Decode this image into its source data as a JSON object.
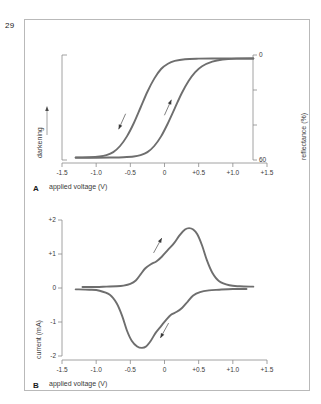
{
  "page": {
    "number": "29"
  },
  "figure": {
    "panels": [
      {
        "letter": "A",
        "xlabel": "applied voltage (V)",
        "ylabel_left": "darkening",
        "ylabel_right": "reflectance (%)"
      },
      {
        "letter": "B",
        "xlabel": "applied voltage (V)",
        "ylabel_left": "current (mA)"
      }
    ]
  },
  "style": {
    "curve_color": "#6e6e6e",
    "axis_color": "#8c8c8c",
    "text_color": "#3a3a3a",
    "frame_color": "#b9b9b9",
    "background": "#ffffff"
  },
  "chart_data": [
    {
      "type": "line",
      "id": "panel-a",
      "title": "",
      "xlabel": "applied voltage (V)",
      "ylabel": "reflectance (%)",
      "ylabel_secondary": "darkening",
      "xlim": [
        -1.5,
        1.5
      ],
      "ylim": [
        60,
        0
      ],
      "xticks": [
        -1.5,
        -1.0,
        -0.5,
        0,
        0.5,
        1.0,
        1.5
      ],
      "xticklabels": [
        "-1.5",
        "-1.0",
        "-0.5",
        "0",
        "+0.5",
        "+1.0",
        "+1.5"
      ],
      "yticks": [
        0,
        20,
        40,
        60
      ],
      "yticklabels": [
        "0",
        "",
        "",
        "60"
      ],
      "grid": false,
      "legend": false,
      "annotations": [
        {
          "text": "darkening",
          "type": "axis-bracket-arrow",
          "side": "left",
          "direction": "up"
        },
        {
          "text": "",
          "type": "arrow",
          "series": "forward-sweep",
          "x": -0.62,
          "y": 38,
          "direction": "down-left"
        },
        {
          "text": "",
          "type": "arrow",
          "series": "reverse-sweep",
          "x": 0.05,
          "y": 30,
          "direction": "up-right"
        }
      ],
      "series": [
        {
          "name": "forward-sweep",
          "comment": "bleaching branch, transitions at lower voltage",
          "x": [
            -1.3,
            -1.1,
            -0.95,
            -0.85,
            -0.75,
            -0.65,
            -0.55,
            -0.45,
            -0.35,
            -0.25,
            -0.15,
            -0.05,
            0.05,
            0.15,
            0.3,
            0.5,
            0.8,
            1.1,
            1.3
          ],
          "y": [
            58.5,
            58.4,
            58.0,
            57.2,
            55.5,
            52.0,
            46.5,
            39.0,
            30.0,
            21.0,
            13.5,
            8.0,
            5.0,
            3.4,
            2.4,
            2.1,
            2.0,
            2.0,
            2.0
          ]
        },
        {
          "name": "reverse-sweep",
          "comment": "colouring branch, transitions at higher voltage",
          "x": [
            -1.3,
            -1.0,
            -0.8,
            -0.6,
            -0.45,
            -0.35,
            -0.25,
            -0.15,
            -0.05,
            0.05,
            0.15,
            0.25,
            0.35,
            0.45,
            0.55,
            0.7,
            0.85,
            1.05,
            1.3
          ],
          "y": [
            58.7,
            58.7,
            58.6,
            58.4,
            58.0,
            57.2,
            55.5,
            52.0,
            46.5,
            39.0,
            30.5,
            22.0,
            15.0,
            9.8,
            6.4,
            3.8,
            2.6,
            2.1,
            2.0
          ]
        }
      ]
    },
    {
      "type": "line",
      "id": "panel-b",
      "title": "",
      "xlabel": "applied voltage (V)",
      "ylabel": "current (mA)",
      "xlim": [
        -1.5,
        1.5
      ],
      "ylim": [
        -2,
        2
      ],
      "xticks": [
        -1.5,
        -1.0,
        -0.5,
        0,
        0.5,
        1.0,
        1.5
      ],
      "xticklabels": [
        "-1.5",
        "-1.0",
        "-0.5",
        "0",
        "+0.5",
        "+1.0",
        "+1.5"
      ],
      "yticks": [
        -2,
        -1,
        0,
        1,
        2
      ],
      "yticklabels": [
        "-2",
        "-1",
        "0",
        "+1",
        "+2"
      ],
      "grid": false,
      "legend": false,
      "annotations": [
        {
          "text": "",
          "type": "arrow",
          "series": "anodic-sweep",
          "x": -0.1,
          "y": 1.25,
          "direction": "up-right"
        },
        {
          "text": "",
          "type": "arrow",
          "series": "cathodic-sweep",
          "x": 0.0,
          "y": -1.25,
          "direction": "down-left"
        }
      ],
      "series": [
        {
          "name": "anodic-sweep",
          "comment": "positive-going peak with shoulder near -0.15 V, maximum ~ +1.75 mA at +0.35 V",
          "x": [
            -1.2,
            -1.0,
            -0.85,
            -0.7,
            -0.6,
            -0.5,
            -0.42,
            -0.35,
            -0.28,
            -0.2,
            -0.12,
            -0.04,
            0.05,
            0.14,
            0.22,
            0.3,
            0.36,
            0.42,
            0.48,
            0.55,
            0.62,
            0.7,
            0.8,
            0.95,
            1.1,
            1.3
          ],
          "y": [
            0.03,
            0.03,
            0.04,
            0.05,
            0.07,
            0.12,
            0.22,
            0.4,
            0.58,
            0.7,
            0.78,
            0.92,
            1.12,
            1.32,
            1.55,
            1.72,
            1.76,
            1.72,
            1.58,
            1.25,
            0.82,
            0.45,
            0.2,
            0.08,
            0.05,
            0.04
          ]
        },
        {
          "name": "cathodic-sweep",
          "comment": "negative-going trough with shoulder near +0.15 V, minimum ~ -1.75 mA at -0.25 V",
          "x": [
            -1.3,
            -1.1,
            -0.95,
            -0.8,
            -0.7,
            -0.62,
            -0.55,
            -0.48,
            -0.4,
            -0.33,
            -0.27,
            -0.2,
            -0.13,
            -0.05,
            0.03,
            0.1,
            0.18,
            0.26,
            0.34,
            0.42,
            0.52,
            0.65,
            0.8,
            1.0,
            1.2
          ],
          "y": [
            -0.04,
            -0.05,
            -0.08,
            -0.2,
            -0.45,
            -0.82,
            -1.25,
            -1.55,
            -1.72,
            -1.76,
            -1.72,
            -1.55,
            -1.32,
            -1.12,
            -0.92,
            -0.78,
            -0.7,
            -0.58,
            -0.4,
            -0.22,
            -0.12,
            -0.07,
            -0.05,
            -0.03,
            -0.03
          ]
        }
      ]
    }
  ]
}
